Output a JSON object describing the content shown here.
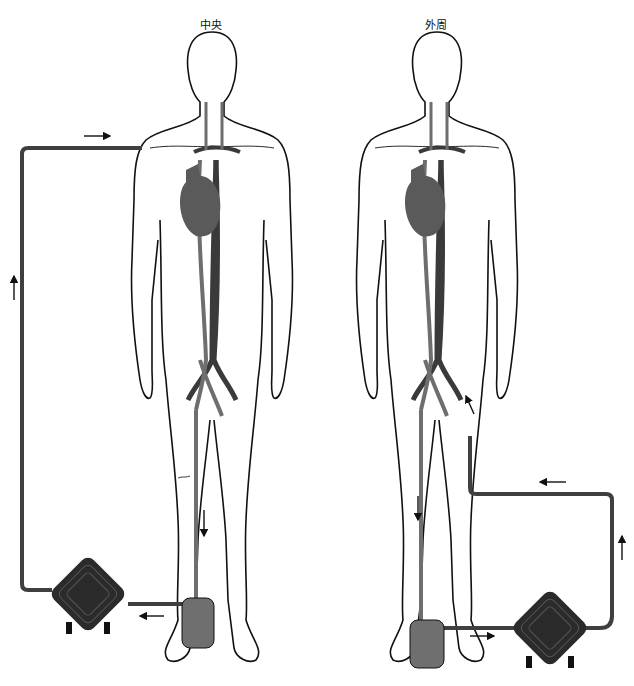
{
  "panels": [
    {
      "id": "central",
      "title": "中央",
      "title_x": 200,
      "title_y": 16
    },
    {
      "id": "peripheral",
      "title": "外周",
      "title_x": 425,
      "title_y": 16
    }
  ],
  "colors": {
    "outline": "#111111",
    "artery": "#3a3a3a",
    "vein": "#6e6e6e",
    "heart": "#5a5a5a",
    "circuit": "#3f3f3f",
    "reservoir": "#6f6f6f",
    "oxygenator": "#2b2b2b"
  },
  "components": {
    "oxygenator": "oxygenator-pump",
    "reservoir": "venous-reservoir",
    "flow_arrows": "flow-direction-arrows"
  }
}
